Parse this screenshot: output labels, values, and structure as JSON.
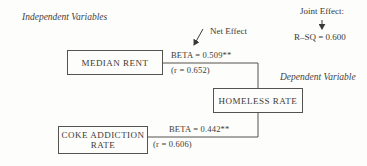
{
  "labels": {
    "independent": "Independent Variables",
    "dependent": "Dependent Variable",
    "net_effect": "Net Effect",
    "joint_effect": "Joint Effect:",
    "r_sq": "R–SQ = 0.600"
  },
  "boxes": {
    "median_rent": "MEDIAN RENT",
    "coke_addiction_line1": "COKE ADDICTION",
    "coke_addiction_line2": "RATE",
    "homeless_rate": "HOMELESS RATE"
  },
  "paths": {
    "rent": {
      "beta": "BETA = 0.509**",
      "r": "(r = 0.652)"
    },
    "coke": {
      "beta": "BETA = 0.442**",
      "r": "(r = 0.606)"
    }
  },
  "colors": {
    "ink": "#3c3a36",
    "line": "#55534d",
    "paper": "#fdfdfb"
  }
}
